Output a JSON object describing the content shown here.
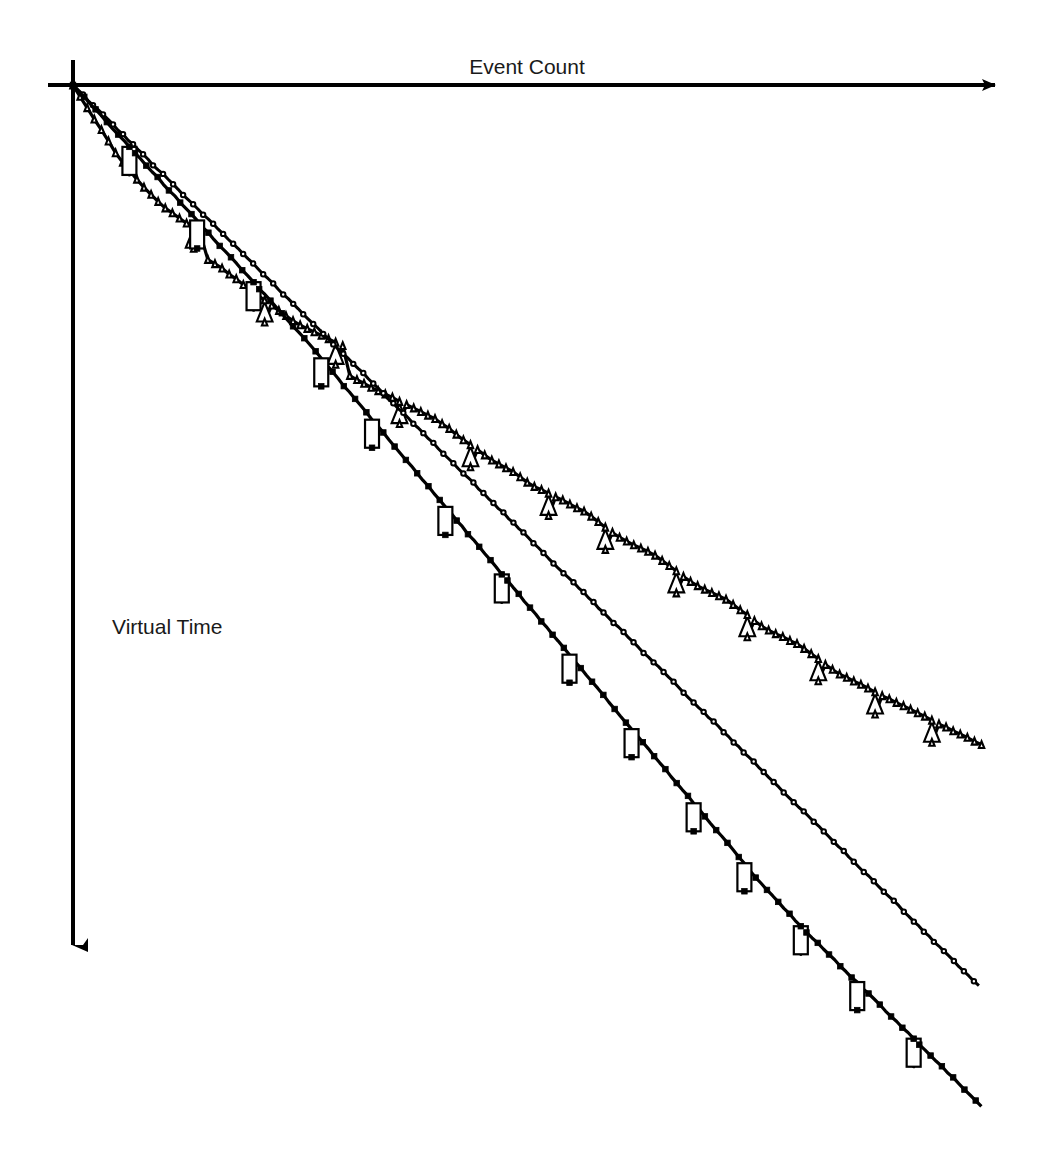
{
  "chart_data": {
    "type": "line",
    "title": "",
    "subtitle": "",
    "xlabel": "Event Count",
    "ylabel": "Virtual Time",
    "xlabel_position": "top-center",
    "ylabel_position": "left-middle",
    "grid": false,
    "legend": false,
    "legend_position": "none",
    "axes_style": "arrows",
    "x_axis_direction": "right",
    "y_axis_direction": "down",
    "xlim": [
      0,
      100
    ],
    "ylim": [
      0,
      100
    ],
    "xticks": [],
    "yticks": [],
    "note": "Virtual Time decreases (plotted downward) as Event Count increases. Three simulation runs shown; each series is a dense marker train with periodic vertical rollback drops.",
    "series": [
      {
        "name": "series-triangle",
        "marker": "triangle-open",
        "marker_fill": "#ffffff",
        "marker_edge": "#000000",
        "line_color": "#000000",
        "description": "Shallowest decline; distinct staircase with regular vertical drops marked by open triangles.",
        "x": [
          0,
          2.5,
          5,
          7.5,
          10,
          12,
          14,
          14.2,
          16,
          18,
          20,
          22,
          24,
          26,
          28,
          30,
          30.2,
          32,
          34,
          36,
          38,
          40,
          42,
          44,
          46,
          48,
          50,
          52,
          54,
          56,
          58,
          60,
          62,
          64,
          66,
          68,
          70,
          72,
          74,
          76,
          78,
          80,
          82,
          84,
          86,
          88,
          90,
          92,
          94,
          96,
          98,
          100
        ],
        "y": [
          0,
          4,
          8,
          11,
          13.5,
          15,
          16,
          19,
          20,
          21.5,
          23,
          24.5,
          26,
          27,
          28,
          29,
          32,
          33,
          34,
          35,
          36,
          37,
          38.5,
          40,
          41.5,
          42.5,
          44,
          45,
          46,
          47,
          48.5,
          50,
          51,
          52,
          53.5,
          55,
          56,
          57,
          58.5,
          60,
          61,
          62,
          63.5,
          65,
          66,
          67,
          68,
          69,
          70,
          71,
          72,
          73
        ]
      },
      {
        "name": "series-circle",
        "marker": "circle-open",
        "marker_fill": "#ffffff",
        "marker_edge": "#000000",
        "line_color": "#000000",
        "description": "Near-linear steady decline; densely packed small open circles, few rollbacks.",
        "x": [
          0,
          5,
          10,
          15,
          20,
          25,
          30,
          35,
          40,
          45,
          50,
          55,
          60,
          65,
          70,
          75,
          80,
          85,
          90,
          95,
          100
        ],
        "y": [
          0,
          5,
          10,
          15,
          20,
          25,
          30,
          35,
          40,
          45,
          50,
          55,
          60,
          65,
          70,
          75,
          80,
          85,
          90,
          95,
          100
        ]
      },
      {
        "name": "series-square",
        "marker": "square-filled",
        "marker_fill": "#000000",
        "marker_edge": "#000000",
        "line_color": "#000000",
        "description": "Steepest decline; filled black squares with frequent sharp vertical rollback segments.",
        "x": [
          0,
          5,
          10,
          15,
          20,
          25,
          30,
          35,
          40,
          45,
          50,
          55,
          60,
          65,
          70,
          75,
          80,
          85,
          90,
          95,
          100
        ],
        "y": [
          0,
          5.5,
          11,
          16.5,
          22,
          27.5,
          33.5,
          39.5,
          45.5,
          51.5,
          57.5,
          63.5,
          69.5,
          75.5,
          81.5,
          87.5,
          93,
          98,
          103,
          108,
          113
        ]
      }
    ]
  },
  "figure": {
    "background_color": "#ffffff",
    "ink_color": "#000000"
  }
}
